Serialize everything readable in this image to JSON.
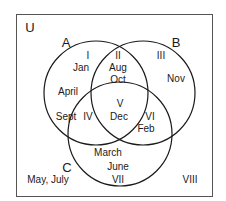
{
  "diagram": {
    "type": "venn-3-set",
    "universe_label": "U",
    "sets": [
      {
        "name": "A",
        "label": "A"
      },
      {
        "name": "B",
        "label": "B"
      },
      {
        "name": "C",
        "label": "C"
      }
    ],
    "colors": {
      "stroke": "#1a1a1a",
      "background": "#ffffff"
    },
    "regions": {
      "I": {
        "roman": "I",
        "items": "Jan, April"
      },
      "II": {
        "roman": "II",
        "items": "Aug, Oct"
      },
      "III": {
        "roman": "III",
        "items": "Nov"
      },
      "IV": {
        "roman": "IV",
        "items": "Sept"
      },
      "V": {
        "roman": "V",
        "items": "Dec"
      },
      "VI": {
        "roman": "VI",
        "items": "Feb"
      },
      "VII": {
        "roman": "VII",
        "items": "March, June"
      },
      "VIII": {
        "roman": "VIII",
        "items": "May, July"
      }
    },
    "text": {
      "jan": "Jan",
      "april": "April",
      "aug": "Aug",
      "oct": "Oct",
      "nov": "Nov",
      "sept": "Sept",
      "dec": "Dec",
      "feb": "Feb",
      "march": "March",
      "june": "June",
      "may_july": "May, July"
    }
  }
}
